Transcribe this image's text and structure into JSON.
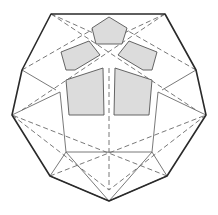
{
  "diagram": {
    "title": "",
    "colors": {
      "background": "#ffffff",
      "outline": "#2a2a2a",
      "edge": "#6a6a6a",
      "face_fill": "#dcdcdc",
      "face_stroke": "#555555"
    },
    "outline_points": "51,14 165,14 196,70 206,115 167,176 109,201 50,176 12,115 22,70",
    "visible_edges": [
      "M60,92 L66,152",
      "M158,92 L152,152",
      "M66,152 L152,152",
      "M22,70 L56,90",
      "M196,70 L162,90",
      "M50,176 L109,201",
      "M167,176 L109,201",
      "M50,176 L66,152",
      "M167,176 L152,152",
      "M12,115 L60,92",
      "M206,115 L158,92",
      "M109,201 L66,152",
      "M109,201 L152,152"
    ],
    "hidden_edges": [
      "M51,14 L109,40",
      "M165,14 L109,40",
      "M22,70 L109,20",
      "M196,70 L109,20",
      "M51,14 L196,110",
      "M165,14 L22,110",
      "M109,68 L109,190",
      "M12,115 L109,190",
      "M206,115 L109,190",
      "M50,176 L206,115",
      "M167,176 L12,115"
    ],
    "shaded_faces": [
      {
        "name": "top-pentagon",
        "points": "92,28 109,17 127,28 122,44 96,44"
      },
      {
        "name": "upper-left-pentagon",
        "points": "61,52 89,41 100,55 75,70 66,70"
      },
      {
        "name": "upper-right-pentagon",
        "points": "157,52 129,41 118,55 143,70 152,70"
      },
      {
        "name": "lower-left-pentagon",
        "points": "66,80 103,68 104,115 69,115"
      },
      {
        "name": "lower-right-pentagon",
        "points": "152,80 115,68 114,115 149,115"
      }
    ]
  }
}
